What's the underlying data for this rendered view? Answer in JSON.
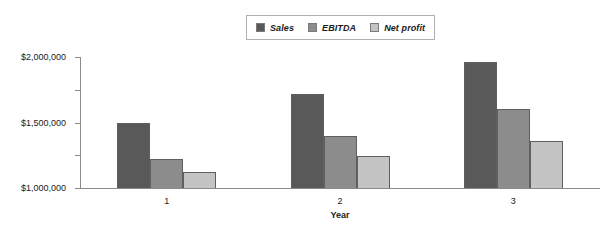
{
  "chart_data": {
    "type": "bar",
    "title": "",
    "xlabel": "Year",
    "ylabel": "",
    "categories": [
      "1",
      "2",
      "3"
    ],
    "series": [
      {
        "name": "Sales",
        "values": [
          1000000,
          1430000,
          1920000
        ],
        "color": "#595959"
      },
      {
        "name": "EBITDA",
        "values": [
          450000,
          800000,
          1200000
        ],
        "color": "#8c8c8c"
      },
      {
        "name": "Net profit",
        "values": [
          250000,
          490000,
          720000
        ],
        "color": "#c4c4c4"
      }
    ],
    "ylim": [
      0,
      2000000
    ],
    "yticks": [
      0,
      500000,
      1000000,
      1500000,
      2000000
    ],
    "ytick_labels": [
      "$0",
      "$500,000",
      "$1,000,000",
      "$1,500,000",
      "$2,000,000"
    ],
    "grid": false,
    "legend_position": "top-center"
  },
  "legend": {
    "entries": [
      {
        "label": "Sales"
      },
      {
        "label": "EBITDA"
      },
      {
        "label": "Net profit"
      }
    ]
  }
}
